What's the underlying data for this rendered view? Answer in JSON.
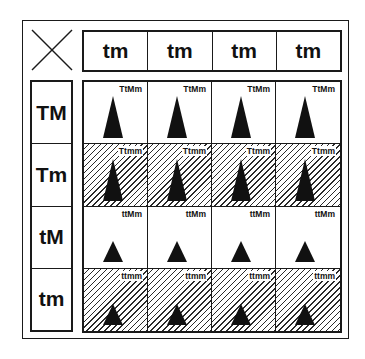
{
  "diagram": {
    "corner_symbol": "cross-icon",
    "column_headers": [
      "tm",
      "tm",
      "tm",
      "tm"
    ],
    "row_headers": [
      "TM",
      "Tm",
      "tM",
      "tm"
    ],
    "rows": [
      {
        "label": "TM",
        "pattern": "plain",
        "plant_height": "tall",
        "cells": [
          "TtMm",
          "TtMm",
          "TtMm",
          "TtMm"
        ]
      },
      {
        "label": "Tm",
        "pattern": "hatched",
        "plant_height": "tall",
        "cells": [
          "Ttmm",
          "Ttmm",
          "Ttmm",
          "Ttmm"
        ]
      },
      {
        "label": "tM",
        "pattern": "plain",
        "plant_height": "short",
        "cells": [
          "ttMm",
          "ttMm",
          "ttMm",
          "ttMm"
        ]
      },
      {
        "label": "tm",
        "pattern": "hatched",
        "plant_height": "short",
        "cells": [
          "ttmm",
          "ttmm",
          "ttmm",
          "ttmm"
        ]
      }
    ],
    "colors": {
      "ink": "#111111",
      "background": "#ffffff"
    }
  }
}
